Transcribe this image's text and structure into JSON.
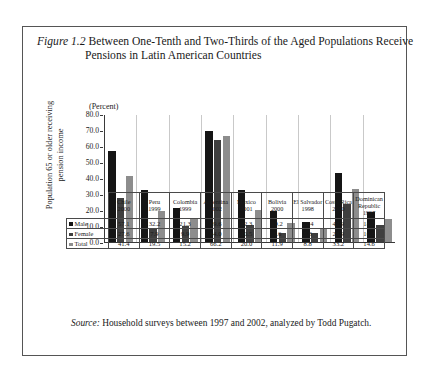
{
  "figure": {
    "label": "Figure 1.2",
    "title": "Between One-Tenth and Two-Thirds of the Aged Populations Receive Pensions in Latin American Countries",
    "unit_caption": "(Percent)",
    "source_label": "Source:",
    "source_text": "Household surveys between 1997 and 2002, analyzed by Todd Pugatch."
  },
  "colors": {
    "male": "#151515",
    "female": "#3f3f3f",
    "total": "#8d8d8d",
    "axis": "#3a3a3a",
    "border": "#555555"
  },
  "chart_data": {
    "type": "bar",
    "title": "Between One-Tenth and Two-Thirds of the Aged Populations Receive Pensions in Latin American Countries",
    "xlabel": "",
    "ylabel": "Population 65 or older receiving pension income",
    "unit": "(Percent)",
    "ylim": [
      0.0,
      80.0
    ],
    "yticks": [
      "0.0",
      "10.0",
      "20.0",
      "30.0",
      "40.0",
      "50.0",
      "60.0",
      "70.0",
      "80.0"
    ],
    "grid": false,
    "legend_position": "table-row-labels",
    "categories": [
      "Chile 2000",
      "Peru 1999",
      "Colombia 1999",
      "Argentina 2002",
      "Mexico 2001",
      "Bolivia 2000",
      "El Salvador 1998",
      "Costa Rica 2000",
      "Dominican Republic 1997"
    ],
    "category_names": [
      "Chile",
      "Peru",
      "Colombia",
      "Argentina",
      "Mexico",
      "Bolivia",
      "El Salvador",
      "Costa Rica",
      "Dominican Republic"
    ],
    "category_years": [
      "2000",
      "1999",
      "1999",
      "2002",
      "2001",
      "2000",
      "1998",
      "2000",
      "1997"
    ],
    "series": [
      {
        "name": "Male",
        "values": [
          57.1,
          32.2,
          21.3,
          69.6,
          32.3,
          19.2,
          12.4,
          42.9,
          18.7
        ]
      },
      {
        "name": "Female",
        "values": [
          27.6,
          7.9,
          9.9,
          64.0,
          10.5,
          5.6,
          5.8,
          23.9,
          10.6
        ]
      },
      {
        "name": "Total",
        "values": [
          41.4,
          19.5,
          15.2,
          66.2,
          20.0,
          11.9,
          8.8,
          33.2,
          14.6
        ]
      }
    ]
  }
}
